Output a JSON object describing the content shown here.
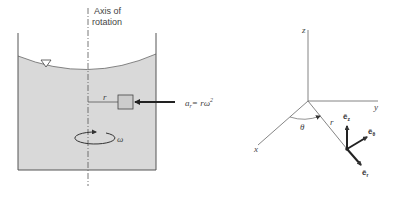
{
  "left_figure": {
    "axis_label_line1": "Axis of",
    "axis_label_line2": "rotation",
    "radius_label": "r",
    "acceleration_label": "a",
    "acceleration_sub": "r",
    "acceleration_eq": "= rω",
    "acceleration_sup": "2",
    "omega_label": "ω",
    "free_surface_symbol": "▽"
  },
  "right_figure": {
    "z_label": "z",
    "y_label": "y",
    "x_label": "x",
    "theta_label": "θ",
    "r_label": "r",
    "e_z": "ê",
    "e_z_sub": "z",
    "e_theta": "ê",
    "e_theta_sub": "θ",
    "e_r": "ê",
    "e_r_sub": "r"
  },
  "colors": {
    "liquid": "#d9d9d9",
    "line": "#555555",
    "arrow": "#222222"
  }
}
